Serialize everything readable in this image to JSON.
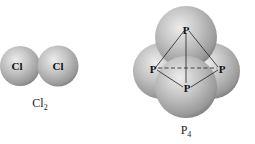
{
  "molecules": [
    {
      "name": "chlorine",
      "atoms": [
        {
          "symbol": "Cl"
        },
        {
          "symbol": "Cl"
        }
      ],
      "caption": {
        "base": "Cl",
        "subscript": "2"
      }
    },
    {
      "name": "phosphorus",
      "atoms": [
        {
          "symbol": "P",
          "position": "top"
        },
        {
          "symbol": "P",
          "position": "left"
        },
        {
          "symbol": "P",
          "position": "right"
        },
        {
          "symbol": "P",
          "position": "bottom"
        }
      ],
      "caption": {
        "base": "P",
        "subscript": "4"
      }
    }
  ],
  "colors": {
    "sphere_light": "#e6e6e6",
    "sphere_mid": "#b3b3b3",
    "sphere_dark": "#7d7d7d",
    "bond_line": "#222222"
  }
}
